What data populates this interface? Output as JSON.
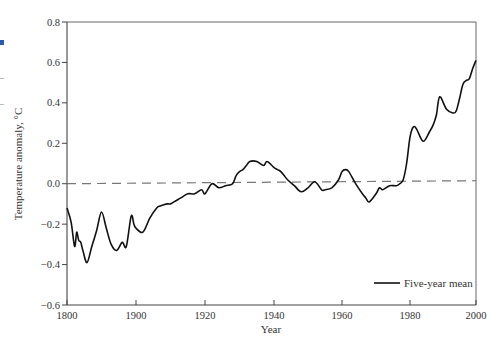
{
  "chart_data": {
    "type": "line",
    "title": "",
    "xlabel": "Year",
    "ylabel": "Temperature anomaly, °C",
    "xlim": [
      1800,
      2000
    ],
    "ylim": [
      -0.6,
      0.8
    ],
    "x_ticks": [
      1800,
      1900,
      1920,
      1940,
      1960,
      1980,
      2000
    ],
    "x_tick_labels": [
      "1800",
      "1900",
      "1920",
      "1940",
      "1960",
      "1980",
      "2000"
    ],
    "x_tick_pixels": [
      67,
      136,
      205,
      274,
      342,
      410,
      476
    ],
    "y_ticks": [
      0.8,
      0.6,
      0.4,
      0.2,
      0.0,
      -0.2,
      -0.4,
      -0.6
    ],
    "y_tick_labels": [
      "0.8",
      "0.6",
      "0.4",
      "0.2",
      "0.0",
      "−0.2",
      "−0.4",
      "−0.6"
    ],
    "grid": false,
    "legend": {
      "position": "lower right",
      "entries": [
        "Five-year mean"
      ]
    },
    "reference_line": {
      "y": 0.0,
      "style": "dashed",
      "color": "#777777"
    },
    "series": [
      {
        "name": "Five-year mean",
        "color": "#111111",
        "x": [
          1800,
          1806,
          1811,
          1814,
          1817,
          1820,
          1823,
          1829,
          1836,
          1843,
          1850,
          1857,
          1864,
          1872,
          1880,
          1886,
          1893,
          1897,
          1900,
          1902,
          1904,
          1906,
          1907,
          1909,
          1910,
          1911,
          1913,
          1915,
          1917,
          1919,
          1920,
          1922,
          1924,
          1926,
          1928,
          1929,
          1930,
          1931,
          1932,
          1933,
          1935,
          1937,
          1938,
          1940,
          1941,
          1942,
          1943,
          1944,
          1946,
          1948,
          1950,
          1952,
          1954,
          1955,
          1957,
          1959,
          1960,
          1961,
          1962,
          1964,
          1966,
          1967,
          1968,
          1970,
          1971,
          1972,
          1974,
          1976,
          1977,
          1978,
          1979,
          1980,
          1981,
          1982,
          1984,
          1986,
          1987,
          1988,
          1989,
          1991,
          1993,
          1994,
          1995,
          1996,
          1997,
          1998,
          1999,
          2000
        ],
        "y": [
          -0.12,
          -0.19,
          -0.31,
          -0.24,
          -0.28,
          -0.29,
          -0.33,
          -0.39,
          -0.31,
          -0.23,
          -0.14,
          -0.22,
          -0.3,
          -0.33,
          -0.29,
          -0.31,
          -0.16,
          -0.2,
          -0.22,
          -0.24,
          -0.17,
          -0.12,
          -0.11,
          -0.1,
          -0.1,
          -0.09,
          -0.07,
          -0.05,
          -0.05,
          -0.03,
          -0.05,
          0.0,
          -0.02,
          -0.01,
          0.0,
          0.04,
          0.06,
          0.07,
          0.09,
          0.11,
          0.11,
          0.09,
          0.11,
          0.08,
          0.07,
          0.06,
          0.04,
          0.02,
          -0.01,
          -0.04,
          -0.02,
          0.01,
          -0.03,
          -0.03,
          -0.02,
          0.02,
          0.06,
          0.07,
          0.06,
          0.0,
          -0.05,
          -0.07,
          -0.09,
          -0.05,
          -0.02,
          -0.03,
          -0.01,
          -0.01,
          0.0,
          0.02,
          0.1,
          0.23,
          0.28,
          0.27,
          0.21,
          0.26,
          0.29,
          0.34,
          0.43,
          0.37,
          0.35,
          0.36,
          0.42,
          0.49,
          0.51,
          0.52,
          0.57,
          0.61
        ]
      }
    ]
  },
  "page_margin_marks": {
    "accent_color": "#2a5caa"
  }
}
